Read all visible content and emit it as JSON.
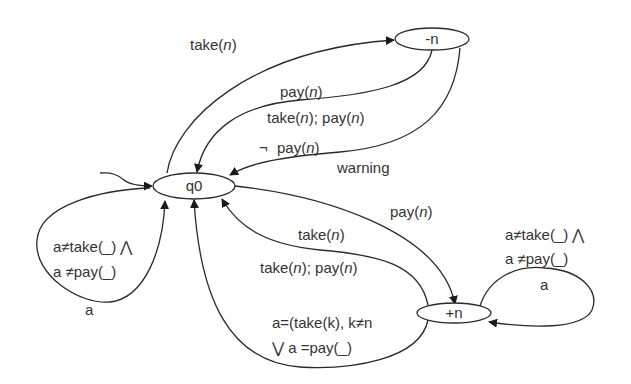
{
  "diagram": {
    "type": "state-machine",
    "nodes": {
      "q0": "q0",
      "minus_n": "-n",
      "plus_n": "+n"
    },
    "edges": {
      "q0_to_minus_n": {
        "label": [
          "take(",
          "n",
          ")"
        ]
      },
      "minus_n_to_q0_pay": {
        "label": [
          "pay(",
          "n",
          ")"
        ]
      },
      "minus_n_to_q0_take_pay": {
        "label": [
          "take(",
          "n",
          "); pay(",
          "n",
          ")"
        ]
      },
      "minus_n_to_q0_warning": {
        "negation": "¬",
        "guard": [
          "pay(",
          "n",
          ")"
        ],
        "output": "warning"
      },
      "q0_to_plus_n": {
        "label": [
          "pay(",
          "n",
          ")"
        ]
      },
      "plus_n_to_q0_take": {
        "label": [
          "take(",
          "n",
          ")"
        ]
      },
      "plus_n_to_q0_take_pay": {
        "label": [
          "take(",
          "n",
          "); pay(",
          "n",
          ")"
        ]
      },
      "plus_n_to_q0_other": {
        "line1": "a=(take(k), k≠n",
        "line2": "⋁  a =pay(_)"
      },
      "q0_self_loop": {
        "line1": "a≠take(_) ⋀",
        "line2": "a ≠pay(_)",
        "action": "a"
      },
      "plus_n_self_loop": {
        "line1": "a≠take(_) ⋀",
        "line2": "a ≠pay(_)",
        "action": "a"
      }
    }
  }
}
